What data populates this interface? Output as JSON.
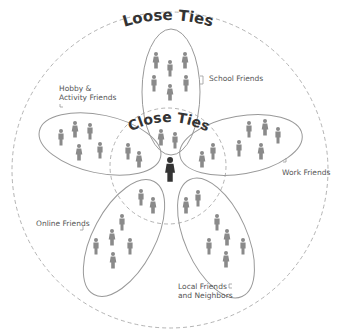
{
  "title_outer": "Loose Ties",
  "title_inner": "Close Ties",
  "groups": [
    {
      "label": "School Friends",
      "people_outer": 6,
      "people_inner": 2
    },
    {
      "label": "Work Friends",
      "people_outer": 5,
      "people_inner": 2
    },
    {
      "label": "Local Friends and Neighbors",
      "label_line1": "Local Friends",
      "label_line2": "and Neighbors",
      "people_outer": 6,
      "people_inner": 2
    },
    {
      "label": "Online Friends",
      "people_outer": 5,
      "people_inner": 2
    },
    {
      "label": "Hobby & Activity Friends",
      "label_line1": "Hobby &",
      "label_line2": "Activity Friends",
      "people_outer": 5,
      "people_inner": 2
    }
  ],
  "center": {
    "label": "You"
  },
  "colors": {
    "stroke": "#999999",
    "person": "#8a8a8a",
    "center_person": "#333333",
    "text": "#555555",
    "title": "#333333"
  }
}
